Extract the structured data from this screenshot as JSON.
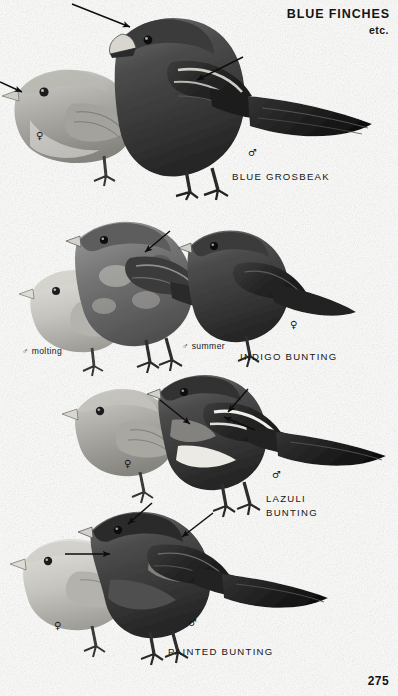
{
  "plate": {
    "title": "BLUE FINCHES",
    "subtitle": "etc.",
    "page_number": "275",
    "background_color": "#fdfdfc",
    "ink_color": "#141414"
  },
  "symbols": {
    "male": "♂",
    "female": "♀"
  },
  "sections": [
    {
      "id": "blue-grosbeak",
      "species_name": "BLUE GROSBEAK",
      "name_x": 232,
      "name_y": 170,
      "labels": [
        {
          "id": "grosbeak-female",
          "text": "♀",
          "x": 36,
          "y": 131
        },
        {
          "id": "grosbeak-male",
          "text": "♂",
          "x": 248,
          "y": 148
        }
      ],
      "arrows": [
        {
          "id": "grosbeak-bill-arrow",
          "x1": 72,
          "y1": 4,
          "x2": 130,
          "y2": 27,
          "target": "heavy bill"
        },
        {
          "id": "grosbeak-wingbar-arrow",
          "x1": 243,
          "y1": 57,
          "x2": 197,
          "y2": 80,
          "target": "wing bars"
        },
        {
          "id": "grosbeak-female-bill-arrow",
          "x1": 0,
          "y1": 82,
          "x2": 22,
          "y2": 92,
          "target": "female bill"
        }
      ]
    },
    {
      "id": "indigo-bunting",
      "species_name": "INDIGO BUNTING",
      "name_x": 240,
      "name_y": 350,
      "labels": [
        {
          "id": "indigo-male-molting",
          "text": "♂ molting",
          "x": 22,
          "y": 346
        },
        {
          "id": "indigo-male-summer",
          "text": "♂ summer",
          "x": 182,
          "y": 341
        },
        {
          "id": "indigo-female",
          "text": "♀",
          "x": 290,
          "y": 320
        }
      ],
      "arrows": [
        {
          "id": "indigo-plumage-arrow",
          "x1": 170,
          "y1": 231,
          "x2": 145,
          "y2": 252,
          "target": "molting plumage"
        }
      ]
    },
    {
      "id": "lazuli-bunting",
      "species_name": "LAZULI\nBUNTING",
      "name_x": 266,
      "name_y": 492,
      "labels": [
        {
          "id": "lazuli-female",
          "text": "♀",
          "x": 124,
          "y": 459
        },
        {
          "id": "lazuli-male",
          "text": "♂",
          "x": 272,
          "y": 470
        }
      ],
      "arrows": [
        {
          "id": "lazuli-wingbar-arrow",
          "x1": 160,
          "y1": 400,
          "x2": 190,
          "y2": 424,
          "target": "white wing bars"
        },
        {
          "id": "lazuli-breast-arrow",
          "x1": 248,
          "y1": 389,
          "x2": 228,
          "y2": 412,
          "target": "rusty breast band"
        },
        {
          "id": "lazuli-belly-arrow",
          "x1": 255,
          "y1": 430,
          "x2": 224,
          "y2": 417,
          "target": "white belly"
        }
      ]
    },
    {
      "id": "painted-bunting",
      "species_name": "PAINTED BUNTING",
      "name_x": 168,
      "name_y": 645,
      "labels": [
        {
          "id": "painted-female",
          "text": "♀",
          "x": 54,
          "y": 621
        },
        {
          "id": "painted-male",
          "text": "♂",
          "x": 188,
          "y": 618
        }
      ],
      "arrows": [
        {
          "id": "painted-head-arrow",
          "x1": 152,
          "y1": 503,
          "x2": 128,
          "y2": 524,
          "target": "blue head"
        },
        {
          "id": "painted-back-arrow",
          "x1": 213,
          "y1": 513,
          "x2": 182,
          "y2": 537,
          "target": "green back"
        },
        {
          "id": "painted-breast-arrow",
          "x1": 65,
          "y1": 554,
          "x2": 110,
          "y2": 554,
          "target": "red underparts"
        }
      ]
    }
  ],
  "figures": [
    {
      "id": "grosbeak-female-figure",
      "label": "female blue grosbeak, perched, facing left"
    },
    {
      "id": "grosbeak-male-figure",
      "label": "male blue grosbeak, perched, facing left"
    },
    {
      "id": "indigo-female-figure",
      "label": "female indigo bunting, perched, facing left"
    },
    {
      "id": "indigo-molting-male-figure",
      "label": "molting male indigo bunting, perched, facing left"
    },
    {
      "id": "indigo-summer-male-figure",
      "label": "summer male indigo bunting, perched, facing left"
    },
    {
      "id": "lazuli-female-figure",
      "label": "female lazuli bunting, perched, facing left"
    },
    {
      "id": "lazuli-male-figure",
      "label": "male lazuli bunting, perched, facing left"
    },
    {
      "id": "painted-female-figure",
      "label": "female painted bunting, perched, facing left"
    },
    {
      "id": "painted-male-figure",
      "label": "male painted bunting, perched, facing left"
    }
  ]
}
